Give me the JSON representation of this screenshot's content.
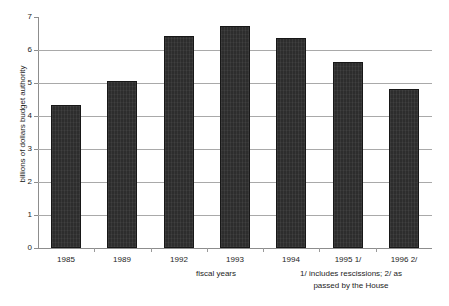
{
  "chart_data": {
    "type": "bar",
    "title": "",
    "categories": [
      "1985",
      "1989",
      "1992",
      "1993",
      "1994",
      "1995 1/",
      "1996 2/"
    ],
    "values": [
      4.33,
      5.07,
      6.41,
      6.72,
      6.35,
      5.65,
      4.81
    ],
    "xlabel": "fiscal years",
    "ylabel": "billions of dollars budget authority",
    "ylim": [
      0,
      7
    ],
    "yticks": [
      "0",
      "1",
      "2",
      "3",
      "4",
      "5",
      "6",
      "7"
    ],
    "grid": "horizontal",
    "legend": "none",
    "bar_color": "#2d2d2d",
    "grid_color": "#a9a9a9",
    "axis_color": "#8d8d8d",
    "annotations": [
      "1/ includes rescissions; 2/ as",
      "passed by the House"
    ],
    "footnote_line1": "1/ includes rescissions; 2/ as",
    "footnote_line2": "passed by the House"
  }
}
